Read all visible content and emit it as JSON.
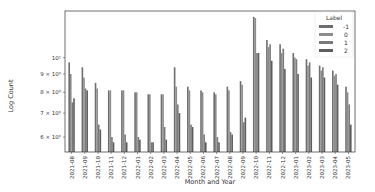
{
  "chart_data": {
    "type": "bar",
    "title": "",
    "xlabel": "Month and Year",
    "ylabel": "Log Count",
    "yscale": "log",
    "ylim": [
      5.45,
      13.5
    ],
    "yticks": [
      {
        "value": 6,
        "label": "6 × 10⁰"
      },
      {
        "value": 7,
        "label": "7 × 10⁰"
      },
      {
        "value": 8,
        "label": "8 × 10⁰"
      },
      {
        "value": 9,
        "label": "9 × 10⁰"
      },
      {
        "value": 10,
        "label": "10¹"
      }
    ],
    "grid": false,
    "legend": {
      "title": "Label",
      "position": "upper right"
    },
    "categories": [
      "2021-08",
      "2021-09",
      "2021-10",
      "2021-11",
      "2021-12",
      "2022-01",
      "2022-02",
      "2022-03",
      "2022-04",
      "2022-05",
      "2022-06",
      "2022-07",
      "2022-08",
      "2022-09",
      "2022-10",
      "2022-11",
      "2022-12",
      "2023-01",
      "2023-02",
      "2023-03",
      "2023-04",
      "2023-05"
    ],
    "series": [
      {
        "name": "-1",
        "color": "#6e6e6e",
        "values": [
          9.7,
          9.4,
          8.5,
          8.1,
          8.1,
          8.0,
          7.9,
          7.9,
          9.4,
          8.3,
          8.1,
          8.0,
          8.3,
          8.6,
          13.0,
          11.2,
          10.9,
          10.3,
          9.9,
          9.5,
          9.2,
          8.3
        ]
      },
      {
        "name": "0",
        "color": "#8c8c8c",
        "values": [
          9.0,
          8.8,
          8.2,
          8.1,
          8.1,
          8.0,
          7.9,
          7.9,
          8.3,
          8.1,
          8.0,
          7.9,
          8.1,
          8.4,
          12.9,
          10.7,
          10.3,
          10.0,
          9.5,
          9.2,
          8.9,
          8.0
        ]
      },
      {
        "name": "1",
        "color": "#7a7a7a",
        "values": [
          7.5,
          8.2,
          6.5,
          6.0,
          6.1,
          6.0,
          5.8,
          6.4,
          7.4,
          6.5,
          6.1,
          6.0,
          6.2,
          6.6,
          10.3,
          10.9,
          10.6,
          9.9,
          9.7,
          9.4,
          9.0,
          7.4
        ]
      },
      {
        "name": "2",
        "color": "#5e5e5e",
        "values": [
          7.7,
          8.1,
          6.3,
          5.8,
          5.8,
          5.9,
          5.8,
          5.9,
          7.0,
          6.4,
          5.8,
          5.8,
          6.1,
          6.8,
          10.3,
          9.8,
          9.3,
          9.0,
          8.8,
          8.8,
          8.4,
          6.5
        ]
      }
    ]
  }
}
